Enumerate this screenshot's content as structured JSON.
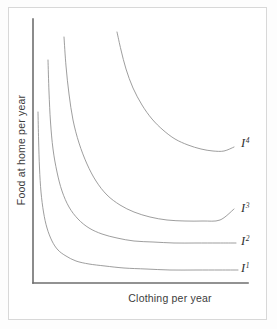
{
  "figure": {
    "kind": "indifference-curve-diagram",
    "background_color": "#ffffff",
    "frame_color": "#d8d8d8",
    "axis_color": "#6e6e6e",
    "curve_color": "#8d8d8d",
    "label_color": "#3c3c3c"
  },
  "axes": {
    "y_label": "Food at home per year",
    "x_label": "Clothing per year"
  },
  "chart_data": {
    "type": "line",
    "title": "",
    "xlabel": "Clothing per year",
    "ylabel": "Food at home per year",
    "grid": false,
    "legend": "inline-right-end-labels",
    "xlim": [
      0,
      1
    ],
    "ylim": [
      0,
      1
    ],
    "axis_ticks": {
      "x": [],
      "y": []
    },
    "series": [
      {
        "name": "I",
        "superscript": "1",
        "label_x": 241,
        "label_y": 272,
        "utility_rank": 1,
        "points": [
          [
            38,
            112
          ],
          [
            38.6,
            140
          ],
          [
            39.5,
            168
          ],
          [
            41,
            192
          ],
          [
            43.5,
            212
          ],
          [
            47,
            228
          ],
          [
            52,
            241
          ],
          [
            58,
            250
          ],
          [
            66,
            256
          ],
          [
            76,
            261
          ],
          [
            89,
            264
          ],
          [
            105,
            266
          ],
          [
            124,
            268
          ],
          [
            146,
            269
          ],
          [
            170,
            270
          ],
          [
            196,
            270
          ],
          [
            220,
            270
          ],
          [
            238,
            270
          ]
        ]
      },
      {
        "name": "I",
        "superscript": "2",
        "label_x": 241,
        "label_y": 245,
        "utility_rank": 2,
        "points": [
          [
            48,
            60
          ],
          [
            49,
            92
          ],
          [
            50.5,
            122
          ],
          [
            53,
            149
          ],
          [
            57,
            172
          ],
          [
            62,
            191
          ],
          [
            69,
            207
          ],
          [
            78,
            219
          ],
          [
            89,
            228
          ],
          [
            102,
            234
          ],
          [
            117,
            238
          ],
          [
            134,
            241
          ],
          [
            153,
            242
          ],
          [
            174,
            243
          ],
          [
            196,
            243
          ],
          [
            218,
            243
          ],
          [
            236,
            243
          ]
        ]
      },
      {
        "name": "I",
        "superscript": "3",
        "label_x": 241,
        "label_y": 212,
        "utility_rank": 3,
        "points": [
          [
            64,
            37
          ],
          [
            66,
            66
          ],
          [
            69,
            94
          ],
          [
            73,
            120
          ],
          [
            79,
            143
          ],
          [
            87,
            164
          ],
          [
            96,
            181
          ],
          [
            107,
            195
          ],
          [
            120,
            205
          ],
          [
            134,
            212
          ],
          [
            150,
            217
          ],
          [
            167,
            220
          ],
          [
            185,
            221
          ],
          [
            203,
            221
          ],
          [
            220,
            220
          ],
          [
            234,
            209
          ]
        ]
      },
      {
        "name": "I",
        "superscript": "4",
        "label_x": 241,
        "label_y": 147,
        "utility_rank": 4,
        "points": [
          [
            117,
            32
          ],
          [
            121,
            50
          ],
          [
            126,
            69
          ],
          [
            133,
            88
          ],
          [
            142,
            105
          ],
          [
            152,
            119
          ],
          [
            163,
            130
          ],
          [
            175,
            139
          ],
          [
            188,
            145
          ],
          [
            201,
            149
          ],
          [
            213,
            151
          ],
          [
            224,
            151
          ],
          [
            234,
            147
          ]
        ]
      }
    ]
  },
  "curve_labels": [
    {
      "letter": "I",
      "sup": "1"
    },
    {
      "letter": "I",
      "sup": "2"
    },
    {
      "letter": "I",
      "sup": "3"
    },
    {
      "letter": "I",
      "sup": "4"
    }
  ]
}
